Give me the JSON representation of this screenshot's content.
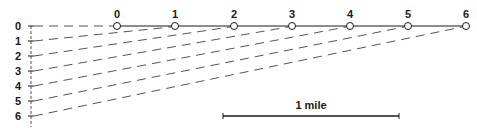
{
  "diagram": {
    "left_axis": {
      "x": 31,
      "top": 26,
      "spacing": 15,
      "extend_to": 127,
      "label_x": 18,
      "labels": [
        "0",
        "1",
        "2",
        "3",
        "4",
        "5",
        "6"
      ]
    },
    "top_line": {
      "y": 26,
      "x_positions": [
        117,
        175,
        234,
        292,
        350,
        408,
        466
      ],
      "labels": [
        "0",
        "1",
        "2",
        "3",
        "4",
        "5",
        "6"
      ],
      "label_y": 18
    },
    "scale_bar": {
      "label": "1 mile",
      "x1": 223,
      "x2": 399,
      "y": 116,
      "label_y": 109
    },
    "colors": {
      "ink": "#1a1a1a",
      "dash": "#555555",
      "background": "#ffffff"
    }
  }
}
